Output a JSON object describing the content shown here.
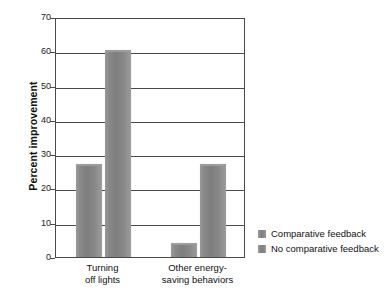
{
  "chart_data": {
    "type": "bar",
    "title": "",
    "xlabel": "",
    "ylabel": "Percent improvement",
    "ylim": [
      0,
      70
    ],
    "yticks": [
      0,
      10,
      20,
      30,
      40,
      50,
      60,
      70
    ],
    "ytick_labels": [
      "0",
      "10",
      "20",
      "30",
      "40",
      "50",
      "60",
      "70"
    ],
    "grid": true,
    "legend_position": "right",
    "categories": [
      "Turning off lights",
      "Other energy-saving behaviors"
    ],
    "category_lines": [
      [
        "Turning",
        "off lights"
      ],
      [
        "Other energy-",
        "saving behaviors"
      ]
    ],
    "series": [
      {
        "name": "Comparative feedback",
        "color": "#868686",
        "values": [
          27,
          4
        ]
      },
      {
        "name": "No comparative feedback",
        "color": "#868686",
        "values": [
          60.5,
          27
        ]
      }
    ]
  },
  "axis": {
    "y_title": "Percent improvement"
  },
  "legend": {
    "items": [
      {
        "label": "Comparative feedback",
        "swatch": "legend-swatch-comparative"
      },
      {
        "label": "No comparative feedback",
        "swatch": "legend-swatch-no-comparative"
      }
    ]
  },
  "colors": {
    "bar_fill": "#868686",
    "axis_line": "#4a4a4a",
    "text": "#111111",
    "background": "#ffffff"
  }
}
